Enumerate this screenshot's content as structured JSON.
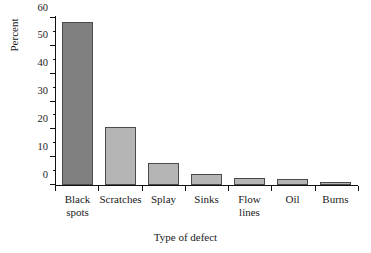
{
  "chart_data": {
    "type": "bar",
    "title": "",
    "xlabel": "Type of defect",
    "ylabel": "Percent",
    "categories": [
      "Black spots",
      "Scratches",
      "Splay",
      "Sinks",
      "Flow lines",
      "Oil",
      "Burns"
    ],
    "category_lines": [
      [
        "Black",
        "spots"
      ],
      [
        "Scratches"
      ],
      [
        "Splay"
      ],
      [
        "Sinks"
      ],
      [
        "Flow",
        "lines"
      ],
      [
        "Oil"
      ],
      [
        "Burns"
      ]
    ],
    "values": [
      58.5,
      21,
      8,
      4,
      2.5,
      2,
      1
    ],
    "ylim": [
      0,
      60
    ],
    "xlim_note": "categorical",
    "y_major_ticks": [
      0,
      10,
      20,
      30,
      40,
      50,
      60
    ],
    "y_tick_labels": [
      "0",
      "10",
      "20",
      "30",
      "40",
      "50",
      "60"
    ],
    "y_minor_ticks": [
      5,
      15,
      25,
      35,
      45,
      55
    ],
    "grid": false,
    "legend": false,
    "legend_position": "none",
    "bar_colors": [
      "#808080",
      "#b5b5b5",
      "#b5b5b5",
      "#b5b5b5",
      "#b5b5b5",
      "#b5b5b5",
      "#b5b5b5"
    ],
    "bar_edge_color": "#4a4a4a",
    "axis_color": "#111111",
    "background_color": "#ffffff"
  }
}
